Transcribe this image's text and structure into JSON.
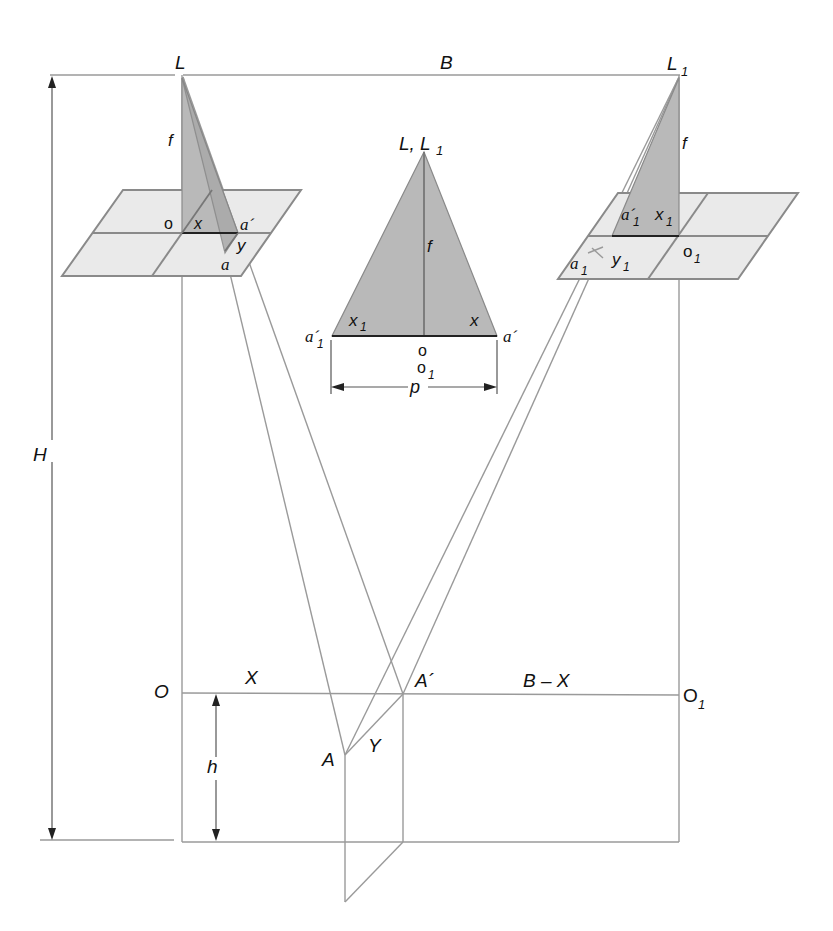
{
  "figure": {
    "labels": {
      "L": "L",
      "L1_main": "L",
      "L1_sub": "1",
      "B": "B",
      "f_left": "f",
      "f_right": "f",
      "o_left": "o",
      "x_left": "x",
      "a_prime_left": "a´",
      "y_left": "y",
      "a_left": "a",
      "a1_prime_main": "a´",
      "a1_prime_sub": "1",
      "x1_main": "x",
      "x1_sub": "1",
      "y1_main": "y",
      "y1_sub": "1",
      "a1_main": "a",
      "a1_sub": "1",
      "o1_main": "o",
      "o1_sub": "1",
      "H": "H",
      "h": "h",
      "O": "O",
      "X": "X",
      "A_prime": "A´",
      "B_minus_X": "B – X",
      "O1_main": "O",
      "O1_sub": "1",
      "A": "A",
      "Y": "Y"
    },
    "inset": {
      "apex_L": "L, L",
      "apex_sub": "1",
      "f": "f",
      "x1_main": "x",
      "x1_sub": "1",
      "x": "x",
      "a1_prime_main": "a´",
      "a1_prime_sub": "1",
      "a_prime": "a´",
      "o": "o",
      "o1_main": "o",
      "o1_sub": "1",
      "p": "p"
    },
    "colors": {
      "line": "#9a9a9a",
      "plane_fill": "#eaeaea",
      "triangle_fill": "#b9b9b9",
      "text": "#111111"
    }
  }
}
